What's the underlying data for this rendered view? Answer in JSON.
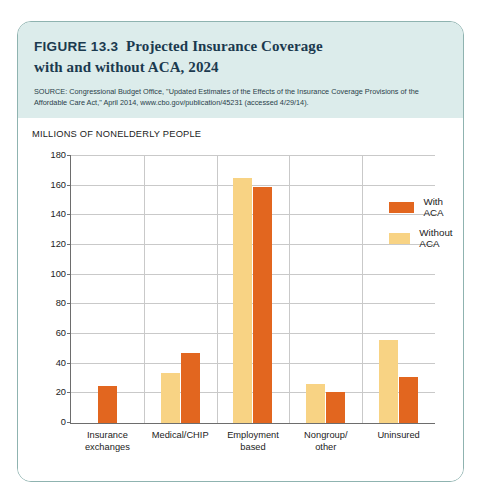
{
  "figure": {
    "label": "FIGURE 13.3",
    "name": "Projected Insurance Coverage",
    "name_line2": "with and without ACA, 2024",
    "source": "SOURCE: Congressional Budget Office, \"Updated Estimates of the Effects of the Insurance Coverage Provisions of the Affordable Care Act,\" April 2014, www.cbo.gov/publication/45231 (accessed 4/29/14)."
  },
  "colors": {
    "with_aca": "#e2661f",
    "without_aca": "#f8d384",
    "header_band": "#dceceb",
    "card_border": "#8fb3b0",
    "gridline": "#c9c9c9",
    "axis": "#6d6d6d"
  },
  "chart_data": {
    "type": "bar",
    "subtitle": "",
    "xlabel": "",
    "ylabel": "MILLIONS OF NONELDERLY PEOPLE",
    "ylim": [
      0,
      180
    ],
    "yticks": [
      0,
      20,
      40,
      60,
      80,
      100,
      120,
      140,
      160,
      180
    ],
    "ytick_labels": [
      "0",
      "20",
      "40",
      "60",
      "80",
      "100",
      "120",
      "140",
      "160",
      "180"
    ],
    "grid": true,
    "legend_position": "upper right inside",
    "categories": [
      "Insurance exchanges",
      "Medical/CHIP",
      "Employment based",
      "Nongroup/ other",
      "Uninsured"
    ],
    "category_lines": [
      [
        "Insurance",
        "exchanges"
      ],
      [
        "Medical/CHIP",
        ""
      ],
      [
        "Employment",
        "based"
      ],
      [
        "Nongroup/",
        "other"
      ],
      [
        "Uninsured",
        ""
      ]
    ],
    "series": [
      {
        "name": "Without ACA",
        "color": "#f8d384",
        "values": [
          0,
          34,
          165,
          26,
          56
        ]
      },
      {
        "name": "With ACA",
        "color": "#e2661f",
        "values": [
          25,
          47,
          159,
          21,
          31
        ]
      }
    ]
  },
  "legend": {
    "items": [
      {
        "label": "With ACA",
        "swatch": "with-aca"
      },
      {
        "label": "Without ACA",
        "swatch": "without-aca"
      }
    ]
  }
}
